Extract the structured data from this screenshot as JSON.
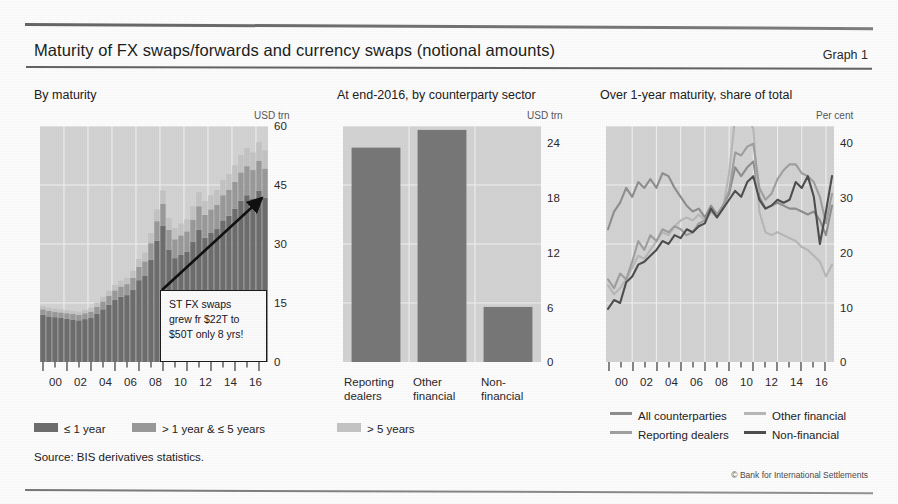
{
  "document": {
    "title": "Maturity of FX swaps/forwards and currency swaps (notional amounts)",
    "graph_number": "Graph 1",
    "source": "Source: BIS derivatives statistics.",
    "copyright": "© Bank for International Settlements"
  },
  "panel1": {
    "title": "By maturity",
    "unit": "USD trn",
    "yticks": [
      "60",
      "45",
      "30",
      "15",
      "0"
    ],
    "xticks": [
      "00",
      "02",
      "04",
      "06",
      "08",
      "10",
      "12",
      "14",
      "16"
    ],
    "legend": [
      {
        "label": "≤ 1 year",
        "color": "#6e6e6e"
      },
      {
        "label": "> 1 year & ≤ 5 years",
        "color": "#9a9a9a"
      },
      {
        "label": "> 5 years",
        "color": "#c4c4c4"
      }
    ],
    "annotation": {
      "line1": "ST FX swaps",
      "line2": "grew fr $22T to",
      "line3": "$50T only 8 yrs!"
    }
  },
  "panel2": {
    "title": "At end-2016, by counterparty sector",
    "unit": "USD trn",
    "yticks": [
      "24",
      "18",
      "12",
      "6",
      "0"
    ],
    "categories": [
      "Reporting\ndealers",
      "Other\nfinancial",
      "Non-\nfinancial"
    ]
  },
  "panel3": {
    "title": "Over 1-year maturity, share of total",
    "unit": "Per cent",
    "yticks": [
      "40",
      "30",
      "20",
      "10",
      "0"
    ],
    "xticks": [
      "00",
      "02",
      "04",
      "06",
      "08",
      "10",
      "12",
      "14",
      "16"
    ],
    "legend": [
      {
        "label": "All counterparties",
        "color": "#8f8f8f"
      },
      {
        "label": "Other financial",
        "color": "#b8b8b8"
      },
      {
        "label": "Reporting dealers",
        "color": "#a0a0a0"
      },
      {
        "label": "Non-financial",
        "color": "#4f4f4f"
      }
    ]
  },
  "chart_data": [
    {
      "id": "by-maturity",
      "type": "bar",
      "stacked": true,
      "title": "By maturity",
      "xlabel": "",
      "ylabel": "USD trn",
      "ylim": [
        0,
        60
      ],
      "yticks": [
        0,
        15,
        30,
        45,
        60
      ],
      "grid": true,
      "legend_position": "below-figure",
      "x": [
        "1998-H1",
        "1998-H2",
        "1999-H1",
        "1999-H2",
        "2000-H1",
        "2000-H2",
        "2001-H1",
        "2001-H2",
        "2002-H1",
        "2002-H2",
        "2003-H1",
        "2003-H2",
        "2004-H1",
        "2004-H2",
        "2005-H1",
        "2005-H2",
        "2006-H1",
        "2006-H2",
        "2007-H1",
        "2007-H2",
        "2008-H1",
        "2008-H2",
        "2009-H1",
        "2009-H2",
        "2010-H1",
        "2010-H2",
        "2011-H1",
        "2011-H2",
        "2012-H1",
        "2012-H2",
        "2013-H1",
        "2013-H2",
        "2014-H1",
        "2014-H2",
        "2015-H1",
        "2015-H2",
        "2016-H1",
        "2016-H2"
      ],
      "tick_years": [
        "00",
        "02",
        "04",
        "06",
        "08",
        "10",
        "12",
        "14",
        "16"
      ],
      "series": [
        {
          "name": "≤ 1 year",
          "color": "#6e6e6e",
          "values": [
            12.0,
            11.6,
            11.4,
            11.2,
            11.0,
            10.8,
            10.6,
            10.9,
            11.2,
            12.2,
            13.4,
            14.6,
            15.8,
            16.6,
            17.0,
            18.4,
            20.8,
            22.0,
            26.0,
            30.8,
            34.6,
            28.6,
            26.4,
            27.2,
            28.0,
            30.6,
            33.6,
            31.6,
            32.8,
            33.8,
            36.0,
            37.2,
            39.0,
            41.0,
            42.4,
            41.6,
            43.6,
            41.8
          ]
        },
        {
          "name": "> 1 year & ≤ 5 years",
          "color": "#9a9a9a",
          "values": [
            1.4,
            1.4,
            1.4,
            1.4,
            1.4,
            1.4,
            1.4,
            1.5,
            1.6,
            1.8,
            2.0,
            2.2,
            2.4,
            2.6,
            2.8,
            3.0,
            3.4,
            3.6,
            4.2,
            5.0,
            5.6,
            5.0,
            4.8,
            5.0,
            5.2,
            5.6,
            6.0,
            5.8,
            6.0,
            6.2,
            6.4,
            6.6,
            6.8,
            7.2,
            7.4,
            7.2,
            7.6,
            7.4
          ]
        },
        {
          "name": "> 5 years",
          "color": "#c4c4c4",
          "values": [
            0.8,
            0.8,
            0.8,
            0.8,
            0.8,
            0.8,
            0.8,
            0.9,
            1.0,
            1.1,
            1.2,
            1.3,
            1.4,
            1.5,
            1.6,
            1.8,
            2.0,
            2.2,
            2.6,
            3.0,
            3.4,
            3.0,
            2.9,
            3.0,
            3.1,
            3.4,
            3.6,
            3.5,
            3.6,
            3.7,
            3.9,
            4.0,
            4.2,
            4.4,
            4.6,
            4.5,
            4.7,
            4.6
          ]
        }
      ],
      "annotation": "ST FX swaps grew fr $22T to $50T only 8 yrs!"
    },
    {
      "id": "by-counterparty-sector",
      "type": "bar",
      "stacked": false,
      "title": "At end-2016, by counterparty sector",
      "xlabel": "",
      "ylabel": "USD trn",
      "ylim": [
        0,
        24
      ],
      "yticks": [
        0,
        6,
        12,
        18,
        24
      ],
      "grid": true,
      "categories": [
        "Reporting dealers",
        "Other financial",
        "Non-financial"
      ],
      "values": [
        21.8,
        23.6,
        5.6
      ],
      "color": "#787878"
    },
    {
      "id": "over-1-year-share",
      "type": "line",
      "title": "Over 1-year maturity, share of total",
      "xlabel": "",
      "ylabel": "Per cent",
      "ylim": [
        0,
        40
      ],
      "yticks": [
        0,
        10,
        20,
        30,
        40
      ],
      "grid": true,
      "legend_position": "below-figure",
      "tick_years": [
        "00",
        "02",
        "04",
        "06",
        "08",
        "10",
        "12",
        "14",
        "16"
      ],
      "x": [
        "1998-H1",
        "1998-H2",
        "1999-H1",
        "1999-H2",
        "2000-H1",
        "2000-H2",
        "2001-H1",
        "2001-H2",
        "2002-H1",
        "2002-H2",
        "2003-H1",
        "2003-H2",
        "2004-H1",
        "2004-H2",
        "2005-H1",
        "2005-H2",
        "2006-H1",
        "2006-H2",
        "2007-H1",
        "2007-H2",
        "2008-H1",
        "2008-H2",
        "2009-H1",
        "2009-H2",
        "2010-H1",
        "2010-H2",
        "2011-H1",
        "2011-H2",
        "2012-H1",
        "2012-H2",
        "2013-H1",
        "2013-H2",
        "2014-H1",
        "2014-H2",
        "2015-H1",
        "2015-H2",
        "2016-H1",
        "2016-H2"
      ],
      "series": [
        {
          "name": "All counterparties",
          "color": "#8f8f8f",
          "values": [
            22.5,
            25.5,
            27.0,
            29.5,
            28.0,
            30.5,
            29.5,
            31.0,
            29.5,
            32.0,
            31.5,
            29.5,
            28.0,
            26.5,
            25.5,
            26.0,
            24.5,
            26.5,
            25.0,
            26.5,
            28.5,
            33.0,
            31.5,
            33.0,
            34.0,
            28.0,
            26.0,
            26.5,
            27.0,
            26.5,
            26.0,
            26.0,
            25.5,
            25.0,
            25.5,
            24.0,
            21.5,
            26.5
          ]
        },
        {
          "name": "Other financial",
          "color": "#b8b8b8",
          "values": [
            13.0,
            11.5,
            12.5,
            14.0,
            16.0,
            18.0,
            17.5,
            19.0,
            20.5,
            22.0,
            21.5,
            23.0,
            24.0,
            24.5,
            24.0,
            25.0,
            24.0,
            25.5,
            24.5,
            26.0,
            32.0,
            41.5,
            41.0,
            42.0,
            39.5,
            25.5,
            22.0,
            21.5,
            22.0,
            21.5,
            21.0,
            20.5,
            19.5,
            19.0,
            18.0,
            17.0,
            14.5,
            16.5
          ]
        },
        {
          "name": "Reporting dealers",
          "color": "#a0a0a0",
          "values": [
            14.0,
            12.5,
            15.0,
            14.0,
            17.0,
            20.5,
            19.0,
            21.5,
            20.5,
            22.5,
            22.0,
            23.0,
            22.5,
            21.5,
            22.0,
            23.5,
            24.0,
            25.5,
            25.0,
            26.5,
            29.0,
            35.5,
            35.0,
            36.5,
            37.0,
            29.5,
            27.5,
            28.5,
            31.0,
            32.5,
            33.5,
            33.5,
            32.0,
            31.5,
            30.5,
            28.0,
            23.5,
            28.5
          ]
        },
        {
          "name": "Non-financial",
          "color": "#4f4f4f",
          "values": [
            9.0,
            10.5,
            10.0,
            13.5,
            14.5,
            16.5,
            17.0,
            18.0,
            19.0,
            20.5,
            20.0,
            21.5,
            21.0,
            22.5,
            22.0,
            23.0,
            23.5,
            26.0,
            24.5,
            26.0,
            27.5,
            29.0,
            28.0,
            30.5,
            31.5,
            27.5,
            26.0,
            26.5,
            27.5,
            27.0,
            27.5,
            30.5,
            29.5,
            31.5,
            28.0,
            20.0,
            25.5,
            31.5
          ]
        }
      ]
    }
  ]
}
